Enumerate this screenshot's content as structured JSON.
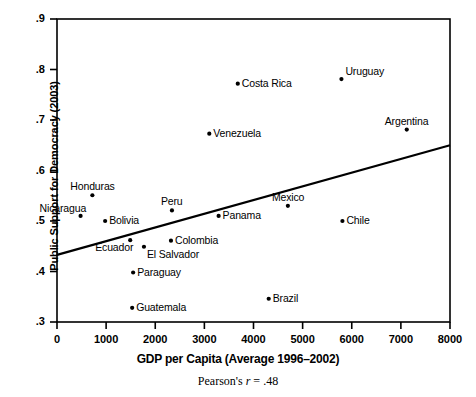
{
  "chart_data": {
    "type": "scatter",
    "title": "",
    "xlabel": "GDP per Capita (Average 1996–2002)",
    "ylabel": "Public Support for Democracy (2003)",
    "annotation": "Pearson's r = .48",
    "annotation_parts": {
      "prefix": "Pearson's ",
      "symbol": "r",
      "suffix": " = .48"
    },
    "correlation": 0.48,
    "xlim": [
      0,
      8000
    ],
    "ylim": [
      0.3,
      0.9
    ],
    "grid": false,
    "legend": null,
    "xticks": [
      0,
      1000,
      2000,
      3000,
      4000,
      5000,
      6000,
      7000,
      8000
    ],
    "xtick_labels": [
      "0",
      "1000",
      "2000",
      "3000",
      "4000",
      "5000",
      "6000",
      "7000",
      "8000"
    ],
    "yticks": [
      0.3,
      0.4,
      0.5,
      0.6,
      0.7,
      0.8,
      0.9
    ],
    "ytick_labels": [
      ".3",
      ".4",
      ".5",
      ".6",
      ".7",
      ".8",
      ".9"
    ],
    "trendline": {
      "x0": 0,
      "y0": 0.433,
      "x1": 8000,
      "y1": 0.65
    },
    "points": [
      {
        "label": "Nicaragua",
        "x": 480,
        "y": 0.51,
        "label_pos": "above-left"
      },
      {
        "label": "Honduras",
        "x": 720,
        "y": 0.551,
        "label_pos": "above"
      },
      {
        "label": "Bolivia",
        "x": 980,
        "y": 0.5,
        "label_pos": "right"
      },
      {
        "label": "Ecuador",
        "x": 1490,
        "y": 0.462,
        "label_pos": "below-left"
      },
      {
        "label": "Guatemala",
        "x": 1530,
        "y": 0.328,
        "label_pos": "right"
      },
      {
        "label": "Paraguay",
        "x": 1550,
        "y": 0.398,
        "label_pos": "right"
      },
      {
        "label": "El Salvador",
        "x": 1770,
        "y": 0.449,
        "label_pos": "below-right"
      },
      {
        "label": "Colombia",
        "x": 2320,
        "y": 0.461,
        "label_pos": "right"
      },
      {
        "label": "Peru",
        "x": 2340,
        "y": 0.521,
        "label_pos": "above"
      },
      {
        "label": "Venezuela",
        "x": 3100,
        "y": 0.673,
        "label_pos": "right"
      },
      {
        "label": "Panama",
        "x": 3290,
        "y": 0.51,
        "label_pos": "right"
      },
      {
        "label": "Costa Rica",
        "x": 3680,
        "y": 0.772,
        "label_pos": "right"
      },
      {
        "label": "Brazil",
        "x": 4310,
        "y": 0.346,
        "label_pos": "right"
      },
      {
        "label": "Mexico",
        "x": 4700,
        "y": 0.53,
        "label_pos": "above"
      },
      {
        "label": "Uruguay",
        "x": 5790,
        "y": 0.781,
        "label_pos": "above-right"
      },
      {
        "label": "Chile",
        "x": 5810,
        "y": 0.5,
        "label_pos": "right"
      },
      {
        "label": "Argentina",
        "x": 7120,
        "y": 0.681,
        "label_pos": "above"
      }
    ]
  }
}
